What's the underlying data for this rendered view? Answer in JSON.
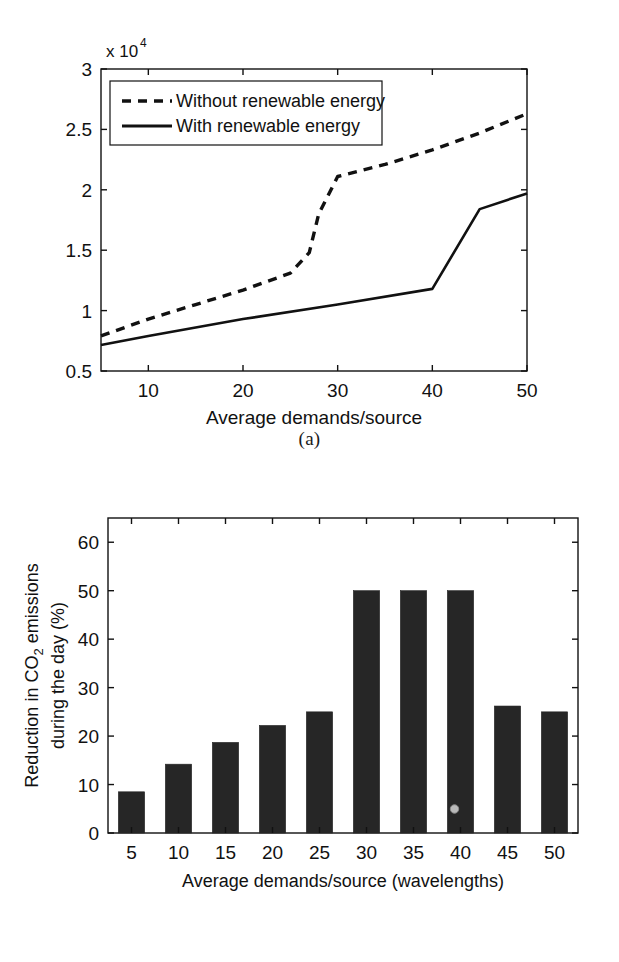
{
  "figure": {
    "background": "#ffffff",
    "line_color": "#111111",
    "bar_color": "#262626"
  },
  "panel_a": {
    "caption": "(a)",
    "axis_multiplier_prefix": "x 10",
    "axis_multiplier_exponent": "4",
    "xlabel": "Average demands/source",
    "xticks": [
      "10",
      "20",
      "30",
      "40",
      "50"
    ],
    "yticks": [
      "0.5",
      "1",
      "1.5",
      "2",
      "2.5",
      "3"
    ],
    "legend": [
      {
        "label": "Without renewable energy",
        "style": "dashed"
      },
      {
        "label": "With renewable energy",
        "style": "solid"
      }
    ]
  },
  "panel_b": {
    "caption": "(b)",
    "ylabel_line1": "Reduction in CO",
    "ylabel_sub": "2",
    "ylabel_line1_tail": " emissions",
    "ylabel_line2": "during the day (%)",
    "xlabel": "Average demands/source (wavelengths)",
    "xticks": [
      "5",
      "10",
      "15",
      "20",
      "25",
      "30",
      "35",
      "40",
      "45",
      "50"
    ],
    "yticks": [
      "0",
      "10",
      "20",
      "30",
      "40",
      "50",
      "60"
    ]
  },
  "chart_data": [
    {
      "type": "line",
      "panel": "(a)",
      "title": "",
      "xlabel": "Average demands/source",
      "ylabel": "",
      "y_axis_multiplier": 10000,
      "y_axis_multiplier_label": "x 10^4",
      "xlim": [
        5,
        50
      ],
      "ylim": [
        5000,
        30000
      ],
      "xticks": [
        10,
        20,
        30,
        40,
        50
      ],
      "yticks": [
        5000,
        10000,
        15000,
        20000,
        25000,
        30000
      ],
      "ytick_labels": [
        "0.5",
        "1",
        "1.5",
        "2",
        "2.5",
        "3"
      ],
      "grid": false,
      "legend_position": "upper-left-inside",
      "series": [
        {
          "name": "Without renewable energy",
          "style": "dashed",
          "x": [
            5,
            10,
            15,
            20,
            25,
            27,
            28,
            30,
            35,
            40,
            45,
            50
          ],
          "y": [
            7900,
            9300,
            10500,
            11700,
            13100,
            14800,
            18000,
            21100,
            22100,
            23300,
            24700,
            26300
          ]
        },
        {
          "name": "With renewable energy",
          "style": "solid",
          "x": [
            5,
            10,
            20,
            30,
            40,
            45,
            50
          ],
          "y": [
            7150,
            7900,
            9300,
            10500,
            11800,
            18400,
            19700
          ]
        }
      ]
    },
    {
      "type": "bar",
      "panel": "(b)",
      "title": "",
      "xlabel": "Average demands/source (wavelengths)",
      "ylabel": "Reduction in CO2 emissions during the day (%)",
      "categories": [
        "5",
        "10",
        "15",
        "20",
        "25",
        "30",
        "35",
        "40",
        "45",
        "50"
      ],
      "values": [
        8.5,
        14.2,
        18.7,
        22.2,
        25.0,
        50.0,
        50.0,
        50.0,
        26.2,
        25.0
      ],
      "ylim": [
        0,
        65
      ],
      "yticks": [
        0,
        10,
        20,
        30,
        40,
        50,
        60
      ],
      "grid": false,
      "legend_position": "none"
    }
  ]
}
